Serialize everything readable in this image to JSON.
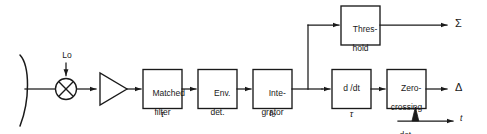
{
  "diagram": {
    "colors": {
      "ink": "#1a1a1a",
      "paper": "#ffffff"
    },
    "input_stage": {
      "antenna_name": "parabolic-reflector-antenna",
      "mixer_name": "mixer",
      "lo_label": "Lo",
      "amplifier_name": "amplifier"
    },
    "blocks": [
      {
        "id": "matched-filter",
        "line1": "Matched",
        "line2": "filter",
        "sub": "τ"
      },
      {
        "id": "envelope-detector",
        "line1": "Env.",
        "line2": "det.",
        "sub": ""
      },
      {
        "id": "integrator",
        "line1": "Inte-",
        "line2": "grator",
        "sub": "t₀"
      },
      {
        "id": "threshold",
        "line1": "Thres-",
        "line2": "hold",
        "sub": ""
      },
      {
        "id": "derivative",
        "line1": "d /dt",
        "line2": "",
        "sub": "τ"
      },
      {
        "id": "zero-crossing-detector",
        "line1": "Zero-",
        "line2": "crossing",
        "line3": "det.",
        "sub": ""
      }
    ],
    "outputs": [
      {
        "id": "sum-output",
        "label": "Σ"
      },
      {
        "id": "delta-output",
        "label": "Δ"
      }
    ],
    "waveform": {
      "id": "output-pulse-waveform",
      "axis_label": "t"
    }
  }
}
